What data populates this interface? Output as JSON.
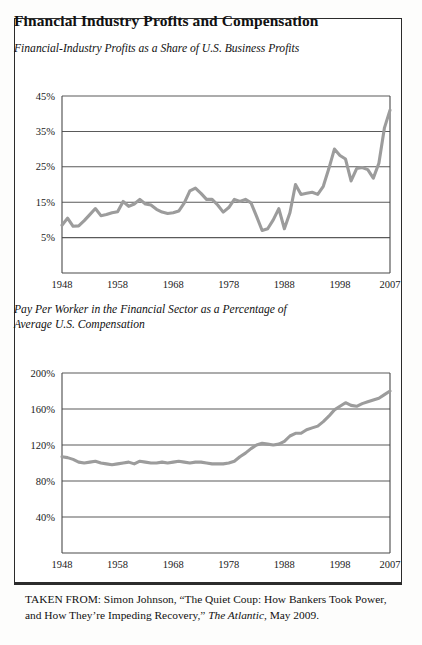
{
  "document": {
    "title": "Financial Industry Profits and Compensation",
    "source_prefix": "TAKEN FROM: ",
    "source_author": "Simon Johnson, ",
    "source_article": "“The Quiet Coup: How Bankers Took Power, and How They’re Impeding Recovery,” ",
    "source_publication": "The Atlantic",
    "source_date": ", May 2009.",
    "source_full": "TAKEN FROM: Simon Johnson, “The Quiet Coup: How Bankers Took Power, and How They’re Impeding Recovery,” The Atlantic, May 2009."
  },
  "chart_data": [
    {
      "type": "line",
      "title": "Financial-Industry Profits as a Share of U.S. Business Profits",
      "xlabel": "",
      "ylabel": "",
      "xlim": [
        1948,
        2007
      ],
      "ylim": [
        0,
        45
      ],
      "grid": true,
      "legend": false,
      "yticks": [
        5,
        15,
        25,
        35,
        45
      ],
      "ytick_labels": [
        "5%",
        "15%",
        "25%",
        "35%",
        "45%"
      ],
      "xticks": [
        1948,
        1958,
        1968,
        1978,
        1988,
        1998,
        2007
      ],
      "xtick_labels": [
        "1948",
        "1958",
        "1968",
        "1978",
        "1988",
        "1998",
        "2007"
      ],
      "line_color": "#9c9c9c",
      "x": [
        1948,
        1949,
        1950,
        1951,
        1952,
        1953,
        1954,
        1955,
        1956,
        1957,
        1958,
        1959,
        1960,
        1961,
        1962,
        1963,
        1964,
        1965,
        1966,
        1967,
        1968,
        1969,
        1970,
        1971,
        1972,
        1973,
        1974,
        1975,
        1976,
        1977,
        1978,
        1979,
        1980,
        1981,
        1982,
        1983,
        1984,
        1985,
        1986,
        1987,
        1988,
        1989,
        1990,
        1991,
        1992,
        1993,
        1994,
        1995,
        1996,
        1997,
        1998,
        1999,
        2000,
        2001,
        2002,
        2003,
        2004,
        2005,
        2006,
        2007
      ],
      "values": [
        8.5,
        10.5,
        8.2,
        8.3,
        9.8,
        11.5,
        13.2,
        11.2,
        11.5,
        12.0,
        12.3,
        15.2,
        13.8,
        14.5,
        15.8,
        14.5,
        14.2,
        13.0,
        12.2,
        11.8,
        12.0,
        12.5,
        14.8,
        18.2,
        19.0,
        17.5,
        15.8,
        15.8,
        14.2,
        12.2,
        13.5,
        15.8,
        15.2,
        15.8,
        14.8,
        11.0,
        7.0,
        7.5,
        10.0,
        13.2,
        7.5,
        12.0,
        20.0,
        17.2,
        17.5,
        17.8,
        17.2,
        19.5,
        24.5,
        30.0,
        28.2,
        27.2,
        21.0,
        24.5,
        24.8,
        24.2,
        21.8,
        26.0,
        36.0,
        41.0
      ]
    },
    {
      "type": "line",
      "title": "Pay Per Worker in the Financial Sector as a Percentage of Average U.S. Compensation",
      "title_line1": "Pay Per Worker in the Financial Sector as a Percentage of",
      "title_line2": "Average U.S. Compensation",
      "xlabel": "",
      "ylabel": "",
      "xlim": [
        1948,
        2007
      ],
      "ylim": [
        0,
        200
      ],
      "grid": true,
      "legend": false,
      "yticks": [
        40,
        80,
        120,
        160,
        200
      ],
      "ytick_labels": [
        "40%",
        "80%",
        "120%",
        "160%",
        "200%"
      ],
      "xticks": [
        1948,
        1958,
        1968,
        1978,
        1988,
        1998,
        2007
      ],
      "xtick_labels": [
        "1948",
        "1958",
        "1968",
        "1978",
        "1988",
        "1998",
        "2007"
      ],
      "line_color": "#9c9c9c",
      "x": [
        1948,
        1949,
        1950,
        1951,
        1952,
        1953,
        1954,
        1955,
        1956,
        1957,
        1958,
        1959,
        1960,
        1961,
        1962,
        1963,
        1964,
        1965,
        1966,
        1967,
        1968,
        1969,
        1970,
        1971,
        1972,
        1973,
        1974,
        1975,
        1976,
        1977,
        1978,
        1979,
        1980,
        1981,
        1982,
        1983,
        1984,
        1985,
        1986,
        1987,
        1988,
        1989,
        1990,
        1991,
        1992,
        1993,
        1994,
        1995,
        1996,
        1997,
        1998,
        1999,
        2000,
        2001,
        2002,
        2003,
        2004,
        2005,
        2006,
        2007
      ],
      "values": [
        107,
        106,
        104,
        101,
        100,
        101,
        102,
        100,
        99,
        98,
        99,
        100,
        101,
        99,
        102,
        101,
        100,
        100,
        101,
        100,
        101,
        102,
        101,
        100,
        101,
        101,
        100,
        99,
        99,
        99,
        100,
        102,
        107,
        111,
        116,
        120,
        122,
        121,
        120,
        121,
        124,
        130,
        133,
        133,
        137,
        139,
        141,
        146,
        152,
        159,
        163,
        167,
        164,
        163,
        166,
        168,
        170,
        172,
        176,
        180
      ]
    }
  ]
}
